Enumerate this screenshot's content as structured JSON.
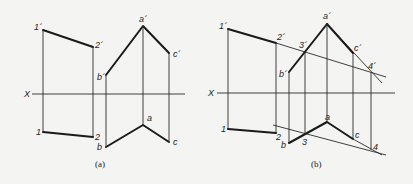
{
  "figure": {
    "panels": [
      {
        "id": "a",
        "caption": "(a)",
        "axis_label": "X",
        "labels": {
          "p1_front": "1´",
          "p2_front": "2´",
          "a_front": "a´",
          "b_front": "b´",
          "c_front": "c´",
          "p1_top": "1",
          "p2_top": "2",
          "a_top": "a",
          "b_top": "b",
          "c_top": "c"
        }
      },
      {
        "id": "b",
        "caption": "(b)",
        "axis_label": "X",
        "labels": {
          "p1_front": "1´",
          "p2_front": "2´",
          "p3_front": "3´",
          "p4_front": "4´",
          "a_front": "a´",
          "b_front": "b´",
          "c_front": "c´",
          "p1_top": "1",
          "p2_top": "2",
          "p3_top": "3",
          "p4_top": "4",
          "a_top": "a",
          "b_top": "b",
          "c_top": "c"
        }
      }
    ],
    "colors": {
      "line": "#1a1a1a",
      "background": "#f4f4f2"
    }
  }
}
